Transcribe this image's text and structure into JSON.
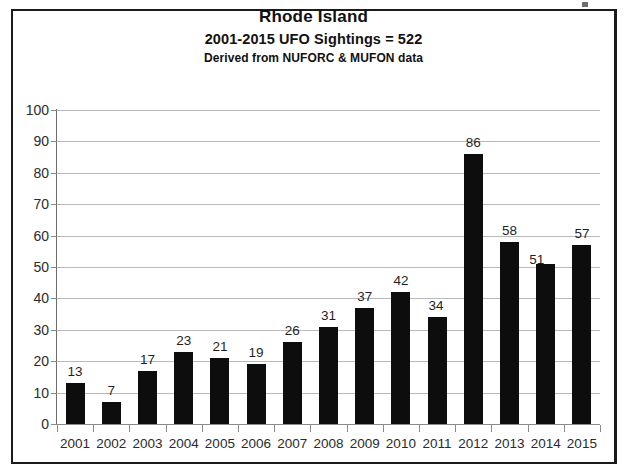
{
  "chart": {
    "title": "Rhode Island",
    "subtitle1": "2001-2015  UFO Sightings = 522",
    "subtitle2": "Derived from NUFORC & MUFON data"
  },
  "colors": {
    "bar": "#0d0d0d",
    "gridline": "#b9b9b9",
    "axis": "#8a8a8a",
    "frame": "#1b1b1b",
    "text": "#1f1f1f",
    "background": "#ffffff"
  },
  "chart_data": {
    "type": "bar",
    "title": "Rhode Island",
    "subtitle": "2001-2015  UFO Sightings = 522",
    "source_note": "Derived from NUFORC & MUFON data",
    "xlabel": "",
    "ylabel": "",
    "ylim": [
      0,
      100
    ],
    "ytick_step": 10,
    "yticks": [
      0,
      10,
      20,
      30,
      40,
      50,
      60,
      70,
      80,
      90,
      100
    ],
    "ytick_labels": [
      "0",
      "10",
      "20",
      "30",
      "40",
      "50",
      "60",
      "70",
      "80",
      "90",
      "100"
    ],
    "grid": true,
    "legend": false,
    "total": 522,
    "categories": [
      "2001",
      "2002",
      "2003",
      "2004",
      "2005",
      "2006",
      "2007",
      "2008",
      "2009",
      "2010",
      "2011",
      "2012",
      "2013",
      "2014",
      "2015"
    ],
    "values": [
      13,
      7,
      17,
      23,
      21,
      19,
      26,
      31,
      37,
      42,
      34,
      86,
      58,
      51,
      57
    ],
    "data_labels": [
      "13",
      "7",
      "17",
      "23",
      "21",
      "19",
      "26",
      "31",
      "37",
      "42",
      "34",
      "86",
      "58",
      "51",
      "57"
    ]
  }
}
